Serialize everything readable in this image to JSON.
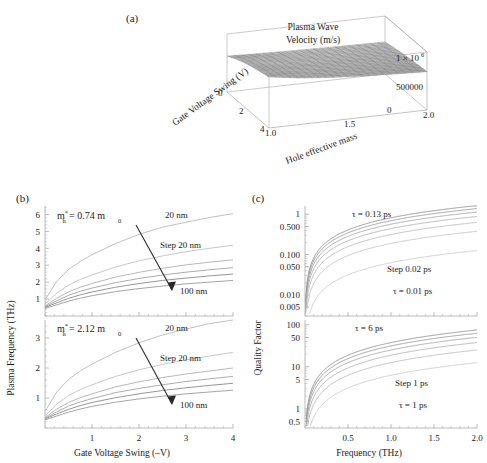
{
  "figure": {
    "panels": [
      {
        "key": "a",
        "label": "(a)"
      },
      {
        "key": "b",
        "label": "(b)"
      },
      {
        "key": "c",
        "label": "(c)"
      }
    ]
  },
  "chart_data": [
    {
      "panel": "(a)",
      "type": "surface",
      "title": "Plasma Wave Velocity (m/s)",
      "title_line1": "Plasma Wave",
      "title_line2": "Velocity (m/s)",
      "xlabel": "Gate Voltage Swing (V)",
      "ylabel": "Hole effective mass",
      "zlabel": "Plasma Wave Velocity (m/s)",
      "xticks": [
        "0",
        "2",
        "4"
      ],
      "yticks": [
        "1.0",
        "1.5",
        "2.0"
      ],
      "zticks": [
        "0",
        "500000",
        "1 × 10⁶"
      ],
      "zlim": [
        0,
        1000000
      ],
      "xlim": [
        0,
        4
      ],
      "ylim": [
        1.0,
        2.0
      ],
      "surface_description": "gray meshed surface, nearly flat, rising slightly toward low gate voltage swing and low effective mass",
      "surface_z_grid": [
        [
          620000,
          600000,
          585000,
          572000,
          562000,
          553000
        ],
        [
          700000,
          660000,
          632000,
          612000,
          596000,
          583000
        ],
        [
          760000,
          706000,
          670000,
          644000,
          624000,
          608000
        ],
        [
          806000,
          742000,
          700000,
          670000,
          646000,
          628000
        ],
        [
          846000,
          774000,
          726000,
          692000,
          666000,
          645000
        ],
        [
          880000,
          800000,
          748000,
          711000,
          683000,
          661000
        ]
      ],
      "grid": true,
      "legend": "none"
    },
    {
      "panel": "(b-top)",
      "type": "line",
      "xlabel": "Gate Voltage Swing (–V)",
      "ylabel": "Plasma Frequency (THz)",
      "xticks": [
        1,
        2,
        3,
        4
      ],
      "xticklabels": [
        "1",
        "2",
        "3",
        "4"
      ],
      "yticks": [
        1,
        2,
        3,
        4,
        5,
        6
      ],
      "yticklabels": [
        "1",
        "2",
        "3",
        "4",
        "5",
        "6"
      ],
      "xlim": [
        0,
        4
      ],
      "ylim": [
        0,
        6.5
      ],
      "annotations": [
        {
          "text": "m*h = 0.74 m0",
          "kind": "mass-label"
        },
        {
          "text": "20 nm",
          "kind": "curve-end-top"
        },
        {
          "text": "Step 20 nm",
          "kind": "step"
        },
        {
          "text": "100 nm",
          "kind": "curve-end-bottom"
        }
      ],
      "arrow": {
        "from_label": "20 nm",
        "to_label": "100 nm"
      },
      "series": [
        {
          "name": "20 nm",
          "color": "#b9b9b9",
          "x": [
            0,
            0.25,
            0.5,
            0.75,
            1,
            1.5,
            2,
            2.5,
            3,
            3.5,
            4
          ],
          "values": [
            0.95,
            2.05,
            2.75,
            3.22,
            3.62,
            4.28,
            4.82,
            5.25,
            5.54,
            5.82,
            6.05
          ]
        },
        {
          "name": "40 nm",
          "color": "#c2c2c2",
          "x": [
            0,
            0.25,
            0.5,
            0.75,
            1,
            1.5,
            2,
            2.5,
            3,
            3.5,
            4
          ],
          "values": [
            0.7,
            1.35,
            1.82,
            2.16,
            2.42,
            2.9,
            3.26,
            3.55,
            3.8,
            4.0,
            4.18
          ]
        },
        {
          "name": "60 nm",
          "color": "#b0b0b0",
          "x": [
            0,
            0.25,
            0.5,
            0.75,
            1,
            1.5,
            2,
            2.5,
            3,
            3.5,
            4
          ],
          "values": [
            0.6,
            1.05,
            1.42,
            1.7,
            1.92,
            2.3,
            2.58,
            2.82,
            3.02,
            3.18,
            3.32
          ]
        },
        {
          "name": "80 nm",
          "color": "#a3a3a3",
          "x": [
            0,
            0.25,
            0.5,
            0.75,
            1,
            1.5,
            2,
            2.5,
            3,
            3.5,
            4
          ],
          "values": [
            0.55,
            0.9,
            1.22,
            1.46,
            1.65,
            1.97,
            2.22,
            2.42,
            2.59,
            2.73,
            2.86
          ]
        },
        {
          "name": "100 nm",
          "color": "#8a8a8a",
          "x": [
            0,
            0.25,
            0.5,
            0.75,
            1,
            1.5,
            2,
            2.5,
            3,
            3.5,
            4
          ],
          "values": [
            0.5,
            0.78,
            1.04,
            1.25,
            1.42,
            1.7,
            1.92,
            2.1,
            2.24,
            2.37,
            2.48
          ]
        },
        {
          "name": "100 nm b",
          "color": "#9b9b9b",
          "x": [
            0,
            0.25,
            0.5,
            0.75,
            1,
            1.5,
            2,
            2.5,
            3,
            3.5,
            4
          ],
          "values": [
            0.45,
            0.66,
            0.88,
            1.05,
            1.2,
            1.44,
            1.62,
            1.77,
            1.9,
            2.0,
            2.1
          ]
        }
      ]
    },
    {
      "panel": "(b-bottom)",
      "type": "line",
      "xlabel": "Gate Voltage Swing (–V)",
      "ylabel": "Plasma Frequency (THz)",
      "xticks": [
        1,
        2,
        3,
        4
      ],
      "xticklabels": [
        "1",
        "2",
        "3",
        "4"
      ],
      "yticks": [
        1,
        2,
        3
      ],
      "yticklabels": [
        "1",
        "2",
        "3"
      ],
      "xlim": [
        0,
        4
      ],
      "ylim": [
        0,
        3.6
      ],
      "annotations": [
        {
          "text": "m*h = 2.12 m0",
          "kind": "mass-label"
        },
        {
          "text": "20 nm",
          "kind": "curve-end-top"
        },
        {
          "text": "Step 20 nm",
          "kind": "step"
        },
        {
          "text": "100 nm",
          "kind": "curve-end-bottom"
        }
      ],
      "arrow": {
        "from_label": "20 nm",
        "to_label": "100 nm"
      },
      "series": [
        {
          "name": "20 nm",
          "color": "#b9b9b9",
          "x": [
            0,
            0.25,
            0.5,
            0.75,
            1,
            1.5,
            2,
            2.5,
            3,
            3.5,
            4
          ],
          "values": [
            0.55,
            1.2,
            1.62,
            1.9,
            2.13,
            2.52,
            2.84,
            3.1,
            3.3,
            3.48,
            3.62
          ]
        },
        {
          "name": "40 nm",
          "color": "#c2c2c2",
          "x": [
            0,
            0.25,
            0.5,
            0.75,
            1,
            1.5,
            2,
            2.5,
            3,
            3.5,
            4
          ],
          "values": [
            0.4,
            0.8,
            1.08,
            1.28,
            1.44,
            1.72,
            1.94,
            2.12,
            2.27,
            2.4,
            2.52
          ]
        },
        {
          "name": "60 nm",
          "color": "#b0b0b0",
          "x": [
            0,
            0.25,
            0.5,
            0.75,
            1,
            1.5,
            2,
            2.5,
            3,
            3.5,
            4
          ],
          "values": [
            0.35,
            0.63,
            0.85,
            1.01,
            1.14,
            1.37,
            1.54,
            1.68,
            1.8,
            1.9,
            2.0
          ]
        },
        {
          "name": "80 nm",
          "color": "#a3a3a3",
          "x": [
            0,
            0.25,
            0.5,
            0.75,
            1,
            1.5,
            2,
            2.5,
            3,
            3.5,
            4
          ],
          "values": [
            0.32,
            0.54,
            0.73,
            0.87,
            0.98,
            1.18,
            1.32,
            1.44,
            1.55,
            1.64,
            1.72
          ]
        },
        {
          "name": "100 nm",
          "color": "#8a8a8a",
          "x": [
            0,
            0.25,
            0.5,
            0.75,
            1,
            1.5,
            2,
            2.5,
            3,
            3.5,
            4
          ],
          "values": [
            0.3,
            0.47,
            0.62,
            0.75,
            0.85,
            1.01,
            1.14,
            1.25,
            1.34,
            1.42,
            1.49
          ]
        },
        {
          "name": "100 nm b",
          "color": "#9b9b9b",
          "x": [
            0,
            0.25,
            0.5,
            0.75,
            1,
            1.5,
            2,
            2.5,
            3,
            3.5,
            4
          ],
          "values": [
            0.27,
            0.4,
            0.53,
            0.63,
            0.72,
            0.86,
            0.97,
            1.06,
            1.14,
            1.2,
            1.26
          ]
        }
      ]
    },
    {
      "panel": "(c-top)",
      "type": "line",
      "xlabel": "Frequency (THz)",
      "ylabel": "Quality Factor",
      "yscale": "log",
      "xticks": [
        0.5,
        1.0,
        1.5,
        2.0
      ],
      "xticklabels": [
        "0.5",
        "1.0",
        "1.5",
        "2.0"
      ],
      "yticks": [
        0.005,
        0.01,
        0.05,
        0.1,
        0.5,
        1
      ],
      "yticklabels": [
        "0.005",
        "0.010",
        "0.050",
        "0.100",
        "0.500",
        "1"
      ],
      "xlim": [
        0,
        2.0
      ],
      "ylim": [
        0.003,
        1.6
      ],
      "annotations": [
        {
          "text": "τ = 0.13 ps",
          "kind": "tau-top"
        },
        {
          "text": "Step 0.02 ps",
          "kind": "step"
        },
        {
          "text": "τ = 0.01 ps",
          "kind": "tau-bottom"
        }
      ],
      "series": [
        {
          "name": "τ = 0.13 ps",
          "tau_ps": 0.13,
          "color": "#8f8f8f"
        },
        {
          "name": "τ = 0.11 ps",
          "tau_ps": 0.11,
          "color": "#999999"
        },
        {
          "name": "τ = 0.09 ps",
          "tau_ps": 0.09,
          "color": "#a5a5a5"
        },
        {
          "name": "τ = 0.07 ps",
          "tau_ps": 0.07,
          "color": "#b0b0b0"
        },
        {
          "name": "τ = 0.05 ps",
          "tau_ps": 0.05,
          "color": "#bababa"
        },
        {
          "name": "τ = 0.03 ps",
          "tau_ps": 0.03,
          "color": "#c3c3c3"
        },
        {
          "name": "τ = 0.01 ps",
          "tau_ps": 0.01,
          "color": "#c9c9c9"
        }
      ],
      "formula": "Q = 2*pi*f*tau"
    },
    {
      "panel": "(c-bottom)",
      "type": "line",
      "xlabel": "Frequency (THz)",
      "ylabel": "Quality Factor",
      "yscale": "log",
      "xticks": [
        0.5,
        1.0,
        1.5,
        2.0
      ],
      "xticklabels": [
        "0.5",
        "1.0",
        "1.5",
        "2.0"
      ],
      "yticks": [
        0.5,
        1,
        5,
        10,
        50,
        100
      ],
      "yticklabels": [
        "0.5",
        "1",
        "5",
        "10",
        "50",
        "100"
      ],
      "xlim": [
        0,
        2.0
      ],
      "ylim": [
        0.35,
        130
      ],
      "annotations": [
        {
          "text": "τ = 6 ps",
          "kind": "tau-top"
        },
        {
          "text": "Step 1 ps",
          "kind": "step"
        },
        {
          "text": "τ = 1 ps",
          "kind": "tau-bottom"
        }
      ],
      "series": [
        {
          "name": "τ = 6 ps",
          "tau_ps": 6,
          "color": "#8f8f8f"
        },
        {
          "name": "τ = 5 ps",
          "tau_ps": 5,
          "color": "#999999"
        },
        {
          "name": "τ = 4 ps",
          "tau_ps": 4,
          "color": "#a5a5a5"
        },
        {
          "name": "τ = 3 ps",
          "tau_ps": 3,
          "color": "#b0b0b0"
        },
        {
          "name": "τ = 2 ps",
          "tau_ps": 2,
          "color": "#bababa"
        },
        {
          "name": "τ = 1 ps",
          "tau_ps": 1,
          "color": "#c9c9c9"
        }
      ],
      "formula": "Q = 2*pi*f*tau"
    }
  ],
  "panel_a": {
    "label": "(a)",
    "title_line1": "Plasma Wave",
    "title_line2": "Velocity (m/s)",
    "xlabel": "Gate Voltage Swing (V)",
    "ylabel": "Hole effective mass",
    "xticks": [
      "0",
      "2",
      "4"
    ],
    "yticks": [
      "1.0",
      "1.5",
      "2.0"
    ],
    "ztick_top": "1 × 10",
    "ztick_top_exp": "6",
    "ztick_mid": "500000",
    "ztick_zero": "0"
  },
  "panel_b": {
    "label": "(b)",
    "ylabel": "Plasma Frequency (THz)",
    "xlabel": "Gate Voltage Swing (–V)",
    "top": {
      "mass_m": "m",
      "mass_sub": "h",
      "mass_star": "*",
      "mass_eq": " = 0.74 m",
      "mass_zero": "0",
      "yticks": [
        "6",
        "5",
        "4",
        "3",
        "2",
        "1"
      ],
      "label_top": "20 nm",
      "label_step": "Step 20 nm",
      "label_bottom": "100 nm"
    },
    "bottom": {
      "mass_m": "m",
      "mass_sub": "h",
      "mass_star": "*",
      "mass_eq": " = 2.12 m",
      "mass_zero": "0",
      "yticks": [
        "3",
        "2",
        "1"
      ],
      "label_top": "20 nm",
      "label_step": "Step 20 nm",
      "label_bottom": "100 nm"
    },
    "xticks": [
      "1",
      "2",
      "3",
      "4"
    ]
  },
  "panel_c": {
    "label": "(c)",
    "ylabel": "Quality Factor",
    "xlabel": "Frequency (THz)",
    "top": {
      "yticks": [
        "1",
        "0.500",
        "0.100",
        "0.050",
        "0.010",
        "0.005"
      ],
      "label_tau_top": "τ = 0.13 ps",
      "label_step": "Step 0.02 ps",
      "label_tau_bottom": "τ = 0.01 ps"
    },
    "bottom": {
      "yticks": [
        "100",
        "50",
        "10",
        "5",
        "1",
        "0.5"
      ],
      "label_tau_top": "τ = 6 ps",
      "label_step": "Step 1 ps",
      "label_tau_bottom": "τ = 1 ps"
    },
    "xticks": [
      "0.5",
      "1.0",
      "1.5",
      "2.0"
    ]
  },
  "colors": {
    "background": "#ffffff",
    "axis": "#9a9a9a",
    "text": "#1a1a1a",
    "curve_light": "#c9c9c9",
    "curve_dark": "#8a8a8a",
    "surface_mesh": "#7d7d7d",
    "surface_fill": "#b5b5b5"
  }
}
